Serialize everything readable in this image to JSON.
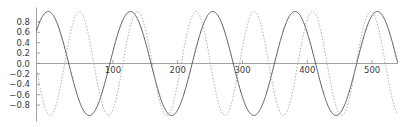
{
  "chart_data": {
    "type": "line",
    "title": "",
    "subtitle": "",
    "xlabel": "",
    "ylabel": "",
    "xlim": [
      -18,
      540
    ],
    "ylim": [
      -1.0,
      1.0
    ],
    "grid": false,
    "legend": null,
    "x_ticks": [
      100,
      200,
      300,
      400,
      500
    ],
    "x_tick_labels": [
      "100",
      "200",
      "300",
      "400",
      "500"
    ],
    "y_ticks": [
      0.8,
      0.6,
      0.4,
      0.2,
      0.0,
      -0.2,
      -0.4,
      -0.6,
      -0.8
    ],
    "y_tick_labels": [
      "0.8",
      "0.6",
      "0.4",
      "0.2",
      "0.0",
      "−0.2",
      "−0.4",
      "−0.6",
      "−0.8"
    ],
    "series": [
      {
        "name": "solid-wave",
        "style": "solid",
        "color": "#3c3c3c",
        "form": "cosine",
        "amplitude": 1.0,
        "period": 127,
        "phase": 0,
        "offset": 0
      },
      {
        "name": "dashed-wave",
        "style": "dashed",
        "color": "#9a9a9a",
        "form": "cosine",
        "amplitude": 1.0,
        "period": 90,
        "phase": 48,
        "offset": 0
      }
    ]
  }
}
